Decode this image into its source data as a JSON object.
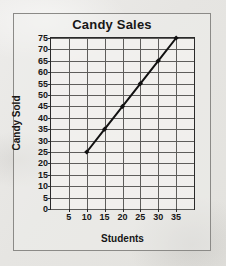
{
  "figure": {
    "background_color": "#e8e7e4",
    "frame_color": "#8b8a87",
    "axis_color": "#2a2a2a",
    "grid_color": "#5e5d5b",
    "series_color": "#111111"
  },
  "chart_data": {
    "type": "line",
    "title": "Candy Sales",
    "xlabel": "Students",
    "ylabel": "Candy Sold",
    "x": [
      10,
      15,
      20,
      25,
      30,
      35
    ],
    "values": [
      25,
      35,
      45,
      55,
      65,
      75
    ],
    "xlim": [
      0,
      40
    ],
    "ylim": [
      0,
      75
    ],
    "xticks": [
      5,
      10,
      15,
      20,
      25,
      30,
      35
    ],
    "xtick_labels": [
      "5",
      "10",
      "15",
      "20",
      "25",
      "30",
      "35"
    ],
    "yticks": [
      0,
      5,
      10,
      15,
      20,
      25,
      30,
      35,
      40,
      45,
      50,
      55,
      60,
      65,
      70,
      75
    ],
    "ytick_labels": [
      "0",
      "5",
      "10",
      "15",
      "20",
      "25",
      "30",
      "35",
      "40",
      "45",
      "50",
      "55",
      "60",
      "65",
      "70",
      "75"
    ],
    "grid": true,
    "legend": null,
    "marker": "diamond",
    "line_width": 2
  }
}
